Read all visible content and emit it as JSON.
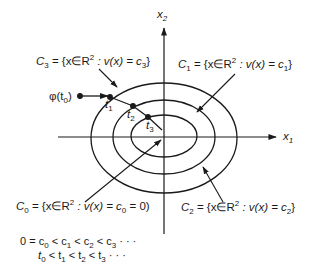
{
  "diagram": {
    "type": "lyapunov-level-sets",
    "axes": {
      "x_label": {
        "base": "x",
        "sub": "1"
      },
      "y_label": {
        "base": "x",
        "sub": "2"
      },
      "origin": [
        164,
        137
      ]
    },
    "level_sets": [
      {
        "id": "C0",
        "label_prefix": "C",
        "label_sub": "0",
        "label_body_a": " = {x∈R",
        "sup": "2",
        "label_body_b": " : v(x) = c",
        "const_sub": "0",
        "label_tail": " = 0)",
        "rx": 0,
        "ry": 0
      },
      {
        "id": "C1",
        "label_prefix": "C",
        "label_sub": "1",
        "label_body_a": " = {x∈R",
        "sup": "2",
        "label_body_b": " : v(x) = c",
        "const_sub": "1",
        "label_tail": "}",
        "rx": 73,
        "ry": 55
      },
      {
        "id": "C2",
        "label_prefix": "C",
        "label_sub": "2",
        "label_body_a": " = {x∈R",
        "sup": "2",
        "label_body_b": " : v(x) = c",
        "const_sub": "2",
        "label_tail": "}",
        "rx": 51,
        "ry": 37
      },
      {
        "id": "C3",
        "label_prefix": "C",
        "label_sub": "3",
        "label_body_a": " = {x∈R",
        "sup": "2",
        "label_body_b": " : v(x) = c",
        "const_sub": "3",
        "label_tail": "}",
        "rx": 33,
        "ry": 21
      }
    ],
    "trajectory": {
      "start_label": {
        "prefix": "φ(t",
        "sub": "0",
        "suffix": ")"
      },
      "points": [
        {
          "label": "t",
          "sub": "1"
        },
        {
          "label": "t",
          "sub": "2"
        },
        {
          "label": "t",
          "sub": "3"
        }
      ]
    },
    "inequalities": {
      "line1": {
        "parts": [
          "0 = c",
          "0",
          " < c",
          "1",
          "  < c",
          "2",
          " < c",
          "3",
          " · · ·"
        ]
      },
      "line2": {
        "parts": [
          "t",
          "0",
          " < t",
          "1",
          "  < t",
          "2",
          " < t",
          "3",
          " · · ·"
        ]
      }
    }
  }
}
